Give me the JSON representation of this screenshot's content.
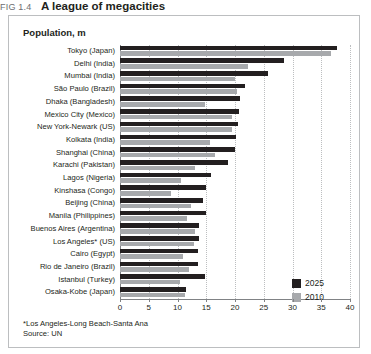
{
  "figure": {
    "number": "FIG 1.4",
    "name": "A league of megacities"
  },
  "panel": {
    "title": "Population, m"
  },
  "legend": {
    "position": "bottom-right",
    "items": [
      {
        "label": "2025",
        "color": "#231f20"
      },
      {
        "label": "2010",
        "color": "#a7a9ac"
      }
    ]
  },
  "footnotes": [
    "*Los Angeles-Long Beach-Santa Ana",
    "Source: UN"
  ],
  "axis": {
    "ticks": [
      "0",
      "5",
      "10",
      "15",
      "20",
      "25",
      "30",
      "35",
      "40"
    ],
    "min": 0,
    "max": 40,
    "step": 5
  },
  "chart_data": {
    "type": "bar",
    "orientation": "horizontal",
    "title": "A league of megacities",
    "subtitle": "Population, m",
    "xlabel": "",
    "ylabel": "",
    "xlim": [
      0,
      40
    ],
    "grid": true,
    "legend_position": "bottom-right",
    "categories": [
      "Tokyo (Japan)",
      "Delhi (India)",
      "Mumbai (India)",
      "São Paulo (Brazil)",
      "Dhaka (Bangladesh)",
      "Mexico City (Mexico)",
      "New York-Newark (US)",
      "Kolkata (India)",
      "Shanghai (China)",
      "Karachi (Pakistan)",
      "Lagos (Nigeria)",
      "Kinshasa (Congo)",
      "Beijing (China)",
      "Manila (Philippines)",
      "Buenos Aires (Argentina)",
      "Los Angeles* (US)",
      "Cairo (Egypt)",
      "Rio de Janeiro (Brazil)",
      "Istanbul (Turkey)",
      "Osaka-Kobe (Japan)"
    ],
    "series": [
      {
        "name": "2025",
        "color": "#231f20",
        "values": [
          37.7,
          28.6,
          25.8,
          21.7,
          20.9,
          20.7,
          20.6,
          20.1,
          20.0,
          18.7,
          15.8,
          15.0,
          14.5,
          14.9,
          13.7,
          13.7,
          13.5,
          13.6,
          14.8,
          11.4
        ]
      },
      {
        "name": "2010",
        "color": "#a7a9ac",
        "values": [
          36.7,
          22.2,
          20.0,
          20.3,
          14.7,
          19.5,
          19.4,
          15.6,
          16.6,
          13.1,
          10.6,
          8.8,
          12.4,
          11.6,
          13.1,
          12.8,
          11.0,
          12.0,
          10.5,
          11.3
        ]
      }
    ]
  }
}
